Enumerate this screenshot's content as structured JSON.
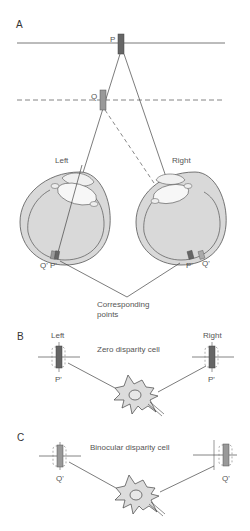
{
  "panels": {
    "a": {
      "letter": "A",
      "point_p": "P",
      "point_q": "Q",
      "eye_left": "Left",
      "eye_right": "Right",
      "left_q": "Q'",
      "left_p": "P'",
      "right_p": "P'",
      "right_q": "Q'",
      "caption_line1": "Corresponding",
      "caption_line2": "points"
    },
    "b": {
      "letter": "B",
      "left": "Left",
      "right": "Right",
      "title": "Zero disparity cell",
      "left_point": "P'",
      "right_point": "P'"
    },
    "c": {
      "letter": "C",
      "title": "Binocular disparity cell",
      "left_point": "Q'",
      "right_point": "Q'"
    }
  },
  "colors": {
    "eye_fill": "#d9d9d9",
    "lens_fill": "#f4f4f4",
    "p_marker": "#666666",
    "q_marker": "#999999",
    "neuron_fill": "#dcdcdc",
    "line": "#444444"
  }
}
